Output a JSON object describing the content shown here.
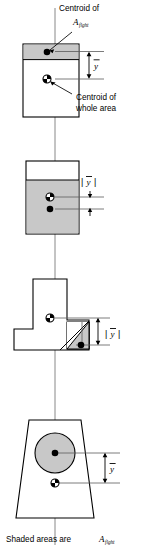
{
  "figure": {
    "title_caption": "Shaded areas are",
    "area_symbol": "A",
    "area_subscript": "flght",
    "callouts": [
      {
        "id": "centroid-of-aflght",
        "line1": "Centroid of",
        "symbol": "A",
        "subscript": "flght"
      },
      {
        "id": "centroid-of-whole-area",
        "line1": "Centroid of",
        "line2": "whole area"
      }
    ],
    "ybar_symbol": "y",
    "abs_bar": "|",
    "panels": [
      {
        "id": "panel-1-rectangle-top-flange",
        "shape": "rectangle",
        "shaded_region": "top-band",
        "dimension_label": "ybar",
        "dimension_style": "plain",
        "markers": [
          "centroid-of-shaded-area",
          "centroid-of-whole-area"
        ]
      },
      {
        "id": "panel-2-rectangle-lower-shaded",
        "shape": "rectangle",
        "shaded_region": "lower-band",
        "dimension_label": "ybar",
        "dimension_style": "absolute",
        "markers": [
          "centroid-of-whole-area",
          "centroid-of-shaded-area"
        ]
      },
      {
        "id": "panel-3-tee-section",
        "shape": "tee-section",
        "shaded_region": "lower-right-triangle",
        "dimension_label": "ybar",
        "dimension_style": "absolute",
        "markers": [
          "centroid-of-whole-area",
          "centroid-of-shaded-area"
        ]
      },
      {
        "id": "panel-4-trapezoid-with-circle",
        "shape": "trapezoid",
        "shaded_region": "circle",
        "dimension_label": "ybar",
        "dimension_style": "plain",
        "markers": [
          "centroid-of-shaded-circle",
          "centroid-of-whole-area"
        ]
      }
    ],
    "colors": {
      "shade_fill": "#c8c8c8",
      "outline": "#000000",
      "axis": "#7a7a7a",
      "background": "#ffffff"
    }
  }
}
